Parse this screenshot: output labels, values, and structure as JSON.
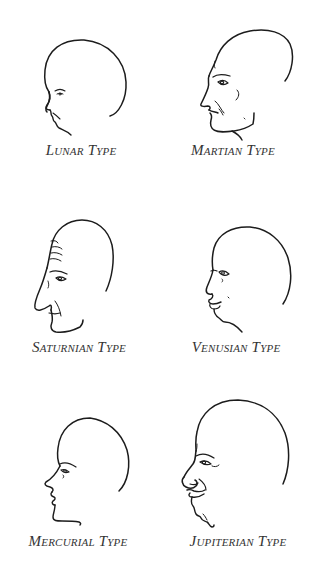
{
  "figure": {
    "panels": [
      {
        "id": "lunar",
        "caption": "Lunar Type",
        "caption_pos": {
          "x": 81,
          "y": 143
        }
      },
      {
        "id": "martian",
        "caption": "Martian Type",
        "caption_pos": {
          "x": 233,
          "y": 143
        }
      },
      {
        "id": "saturnian",
        "caption": "Saturnian Type",
        "caption_pos": {
          "x": 79,
          "y": 340
        }
      },
      {
        "id": "venusian",
        "caption": "Venusian Type",
        "caption_pos": {
          "x": 236,
          "y": 340
        }
      },
      {
        "id": "mercurial",
        "caption": "Mercurial Type",
        "caption_pos": {
          "x": 78,
          "y": 534
        }
      },
      {
        "id": "jupiterian",
        "caption": "Jupiterian Type",
        "caption_pos": {
          "x": 238,
          "y": 534
        }
      }
    ]
  },
  "colors": {
    "background": "#ffffff",
    "ink": "#1c1c1c",
    "caption": "#333333"
  }
}
